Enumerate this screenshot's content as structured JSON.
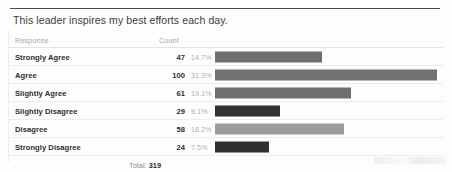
{
  "title": "This leader inspires my best efforts each day.",
  "table": {
    "headers": {
      "response": "Response",
      "count": "Count"
    },
    "rows": [
      {
        "response": "Strongly Agree",
        "count": "47",
        "percent": "14.7%",
        "bar_color": "#6e6e6e",
        "bar_width": 107
      },
      {
        "response": "Agree",
        "count": "100",
        "percent": "31.3%",
        "bar_color": "#727272",
        "bar_width": 222
      },
      {
        "response": "Slightly Agree",
        "count": "61",
        "percent": "19.1%",
        "bar_color": "#6f6f6f",
        "bar_width": 136
      },
      {
        "response": "Slightly Disagree",
        "count": "29",
        "percent": "9.1%",
        "bar_color": "#333333",
        "bar_width": 65
      },
      {
        "response": "Disagree",
        "count": "58",
        "percent": "18.2%",
        "bar_color": "#9c9c9c",
        "bar_width": 129
      },
      {
        "response": "Strongly Disagree",
        "count": "24",
        "percent": "7.5%",
        "bar_color": "#303030",
        "bar_width": 54
      }
    ],
    "footer": {
      "total_label": "Total:",
      "total_value": "319"
    }
  },
  "chart_data": {
    "type": "bar",
    "title": "This leader inspires my best efforts each day.",
    "xlabel": "",
    "ylabel": "",
    "orientation": "horizontal",
    "categories": [
      "Strongly Agree",
      "Agree",
      "Slightly Agree",
      "Slightly Disagree",
      "Disagree",
      "Strongly Disagree"
    ],
    "values": [
      47,
      100,
      61,
      29,
      58,
      24
    ],
    "percentages": [
      14.7,
      31.3,
      19.1,
      9.1,
      18.2,
      7.5
    ],
    "total": 319,
    "grid": false,
    "legend": "none",
    "xlim": [
      0,
      100
    ]
  }
}
